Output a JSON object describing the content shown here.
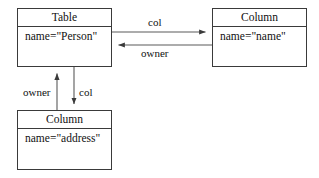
{
  "diagram": {
    "type": "uml-object-diagram",
    "background_color": "#ffffff",
    "stroke_color": "#3a3a3a",
    "text_color": "#111111",
    "nodes": [
      {
        "id": "table-person",
        "title": "Table",
        "attributes": [
          "name=\"Person\""
        ]
      },
      {
        "id": "column-name",
        "title": "Column",
        "attributes": [
          "name=\"name\""
        ]
      },
      {
        "id": "column-address",
        "title": "Column",
        "attributes": [
          "name=\"address\""
        ]
      }
    ],
    "edges": [
      {
        "id": "table-to-column-name",
        "label": "col",
        "from": "table-person",
        "to": "column-name",
        "direction": "right"
      },
      {
        "id": "column-name-to-table",
        "label": "owner",
        "from": "column-name",
        "to": "table-person",
        "direction": "left"
      },
      {
        "id": "column-address-to-table",
        "label": "owner",
        "from": "column-address",
        "to": "table-person",
        "direction": "up"
      },
      {
        "id": "table-to-column-address",
        "label": "col",
        "from": "table-person",
        "to": "column-address",
        "direction": "down"
      }
    ]
  }
}
